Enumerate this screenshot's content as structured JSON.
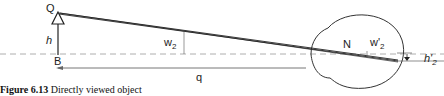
{
  "figure": {
    "caption_number": "Figure 6.13",
    "caption_text": " Directly viewed object"
  },
  "labels": {
    "object_top": "Q",
    "object_base": "B",
    "object_height": "h",
    "angle_object": "w",
    "angle_object_sub": "2",
    "nodal_point": "N",
    "angle_image": "w'",
    "angle_image_sub": "2",
    "image_height": "h'",
    "image_height_sub": "2",
    "distance": "q"
  },
  "colors": {
    "line": "#222222",
    "axis": "#888888",
    "eye": "#333333"
  }
}
